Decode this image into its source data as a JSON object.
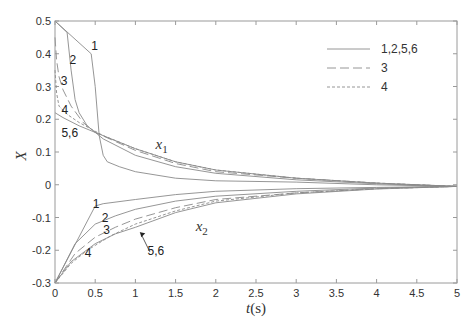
{
  "chart_data": {
    "type": "line",
    "title": "",
    "xlabel": "t(s)",
    "ylabel": "X",
    "xlim": [
      0,
      5
    ],
    "ylim": [
      -0.3,
      0.5
    ],
    "xticks": [
      0,
      0.5,
      1,
      1.5,
      2,
      2.5,
      3,
      3.5,
      4,
      4.5,
      5
    ],
    "xtick_labels": [
      "0",
      "0.5",
      "1",
      "1.5",
      "2",
      "2.5",
      "3",
      "3.5",
      "4",
      "4.5",
      "5"
    ],
    "yticks": [
      -0.3,
      -0.2,
      -0.1,
      0,
      0.1,
      0.2,
      0.3,
      0.4,
      0.5
    ],
    "ytick_labels": [
      "-0.3",
      "-0.2",
      "-0.1",
      "0",
      "0.1",
      "0.2",
      "0.3",
      "0.4",
      "0.5"
    ],
    "grid": false,
    "legend_position": "upper right",
    "legend": [
      {
        "label": "1,2,5,6",
        "style": "solid"
      },
      {
        "label": "3",
        "style": "dashed"
      },
      {
        "label": "4",
        "style": "dotted"
      }
    ],
    "annotations": [
      {
        "text": "x1",
        "sub": "1",
        "base": "x",
        "at": [
          1.25,
          0.11
        ]
      },
      {
        "text": "x2",
        "sub": "2",
        "base": "x",
        "at": [
          1.75,
          -0.14
        ]
      },
      {
        "text": "1",
        "at": [
          0.45,
          0.41
        ]
      },
      {
        "text": "2",
        "at": [
          0.18,
          0.37
        ]
      },
      {
        "text": "3",
        "at": [
          0.07,
          0.305
        ]
      },
      {
        "text": "4",
        "at": [
          0.08,
          0.215
        ]
      },
      {
        "text": "5,6",
        "at": [
          0.08,
          0.145
        ]
      },
      {
        "text": "1",
        "at": [
          0.47,
          -0.07
        ]
      },
      {
        "text": "2",
        "at": [
          0.58,
          -0.115
        ]
      },
      {
        "text": "3",
        "at": [
          0.6,
          -0.15
        ]
      },
      {
        "text": "4",
        "at": [
          0.37,
          -0.22
        ]
      },
      {
        "text": "5,6",
        "at": [
          1.15,
          -0.215
        ]
      }
    ],
    "series": [
      {
        "name": "x1 curve 1",
        "style": "solid",
        "x": [
          0,
          0.45,
          0.5,
          0.55,
          0.6,
          0.65,
          0.8,
          1,
          1.5,
          2,
          3,
          4,
          5
        ],
        "y": [
          0.5,
          0.4,
          0.3,
          0.15,
          0.09,
          0.07,
          0.055,
          0.04,
          0.02,
          0.012,
          0.008,
          0.0,
          -0.005
        ]
      },
      {
        "name": "x1 curve 2",
        "style": "solid",
        "x": [
          0,
          0.15,
          0.2,
          0.25,
          0.3,
          0.4,
          0.6,
          1,
          1.5,
          2,
          3,
          4,
          5
        ],
        "y": [
          0.5,
          0.465,
          0.35,
          0.26,
          0.22,
          0.18,
          0.14,
          0.09,
          0.055,
          0.035,
          0.015,
          0.003,
          -0.005
        ]
      },
      {
        "name": "x1 curve 3",
        "style": "dashed",
        "x": [
          0,
          0.02,
          0.05,
          0.1,
          0.2,
          0.35,
          0.5,
          1,
          1.5,
          2,
          3,
          4,
          5
        ],
        "y": [
          0.45,
          0.38,
          0.33,
          0.29,
          0.24,
          0.19,
          0.16,
          0.105,
          0.065,
          0.04,
          0.02,
          0.005,
          -0.005
        ]
      },
      {
        "name": "x1 curve 4",
        "style": "dotted",
        "x": [
          0,
          0.02,
          0.05,
          0.15,
          0.3,
          0.6,
          1,
          1.5,
          2,
          3,
          4,
          5
        ],
        "y": [
          0.35,
          0.28,
          0.24,
          0.215,
          0.19,
          0.15,
          0.11,
          0.07,
          0.045,
          0.02,
          0.005,
          -0.005
        ]
      },
      {
        "name": "x1 curve 5,6",
        "style": "solid",
        "x": [
          0,
          0.1,
          0.3,
          0.5,
          1,
          1.5,
          2,
          3,
          4,
          5
        ],
        "y": [
          0.22,
          0.205,
          0.18,
          0.16,
          0.11,
          0.07,
          0.045,
          0.02,
          0.005,
          -0.005
        ]
      },
      {
        "name": "x2 curve 1",
        "style": "solid",
        "x": [
          0,
          0.5,
          0.6,
          1,
          1.5,
          2,
          3,
          4,
          5
        ],
        "y": [
          -0.3,
          -0.065,
          -0.058,
          -0.045,
          -0.03,
          -0.02,
          -0.012,
          -0.008,
          -0.005
        ]
      },
      {
        "name": "x2 curve 2",
        "style": "solid",
        "x": [
          0,
          0.25,
          0.5,
          0.75,
          1,
          1.5,
          2,
          3,
          4,
          5
        ],
        "y": [
          -0.3,
          -0.18,
          -0.12,
          -0.095,
          -0.075,
          -0.05,
          -0.035,
          -0.02,
          -0.01,
          -0.005
        ]
      },
      {
        "name": "x2 curve 3",
        "style": "dashed",
        "x": [
          0,
          0.25,
          0.5,
          0.75,
          1,
          1.5,
          2,
          3,
          4,
          5
        ],
        "y": [
          -0.3,
          -0.21,
          -0.16,
          -0.13,
          -0.105,
          -0.07,
          -0.045,
          -0.025,
          -0.012,
          -0.005
        ]
      },
      {
        "name": "x2 curve 4",
        "style": "dotted",
        "x": [
          0,
          0.2,
          0.4,
          0.7,
          1,
          1.5,
          2,
          3,
          4,
          5
        ],
        "y": [
          -0.3,
          -0.24,
          -0.2,
          -0.155,
          -0.12,
          -0.08,
          -0.05,
          -0.025,
          -0.012,
          -0.005
        ]
      },
      {
        "name": "x2 curve 5,6",
        "style": "solid",
        "x": [
          0,
          0.2,
          0.5,
          0.75,
          1,
          1.5,
          2,
          3,
          4,
          5
        ],
        "y": [
          -0.3,
          -0.235,
          -0.18,
          -0.15,
          -0.13,
          -0.085,
          -0.055,
          -0.028,
          -0.013,
          -0.005
        ]
      }
    ]
  },
  "layout": {
    "plot_left": 55,
    "plot_top": 21,
    "plot_right": 457,
    "plot_bottom": 283,
    "line_color": "#8a8a8a",
    "axis_color": "#9a9a9a",
    "text_color": "#333333"
  }
}
